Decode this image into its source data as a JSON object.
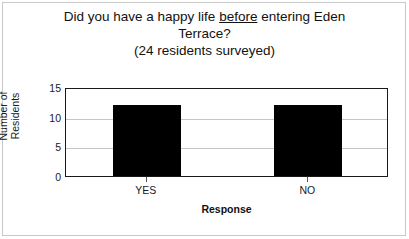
{
  "chart_data": {
    "type": "bar",
    "title_lines": [
      "Did you have a happy life before entering Eden",
      "Terrace?",
      "(24 residents surveyed)"
    ],
    "title_prefix": "Did you have a happy life ",
    "title_emphasis": "before",
    "title_suffix": " entering Eden",
    "title_line2": "Terrace?",
    "title_line3": "(24 residents surveyed)",
    "categories": [
      "YES",
      "NO"
    ],
    "values": [
      12,
      12
    ],
    "xlabel": "Response",
    "ylabel_line1": "Number of",
    "ylabel_line2": "Residents",
    "ylabel": "Number of Residents",
    "ylim": [
      0,
      15
    ],
    "ytick_labels": [
      "15",
      "10",
      "5",
      "0"
    ],
    "yticks": [
      15,
      10,
      5,
      0
    ],
    "grid": true,
    "legend": "none",
    "bar_color": "#000000",
    "frame_color": "#1a1a1a",
    "grid_color": "#c5c5c5",
    "background": "#ffffff",
    "total_surveyed": 24
  }
}
